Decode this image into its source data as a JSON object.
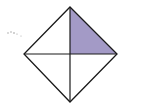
{
  "diagram": {
    "type": "square-divided-into-quarters",
    "vertices": {
      "top": [
        70,
        7
      ],
      "right": [
        117,
        54
      ],
      "bottom": [
        70,
        102
      ],
      "left": [
        24,
        54
      ],
      "center": [
        70,
        54
      ]
    },
    "parts_total": 4,
    "parts_shaded": 1,
    "shaded_region": "upper-right",
    "colors": {
      "stroke": "#1a1a1a",
      "shade": "#a39ac6",
      "background": "#ffffff",
      "marks": "#9a9a9a"
    }
  }
}
